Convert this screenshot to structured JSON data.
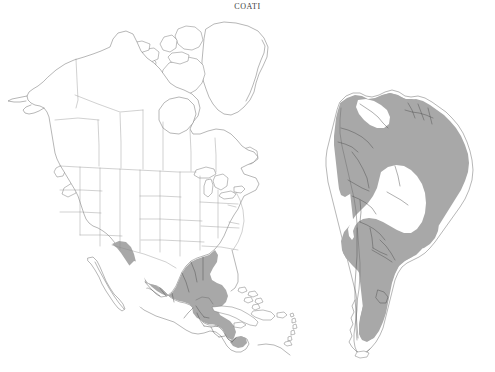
{
  "figure": {
    "title": "COATI",
    "type": "species-distribution-range-map",
    "background_color": "#ffffff",
    "range_fill_color": "#a8a8a8",
    "coastline_color": "#6e6e6e",
    "internal_border_color": "#8c8c8c",
    "title_color": "#3b3b3b"
  },
  "panels": [
    {
      "id": "north-america",
      "label": "North America",
      "position": "left",
      "range_present": true,
      "range_regions": [
        "southern Arizona",
        "southwestern New Mexico",
        "western Mexico",
        "eastern Mexico",
        "southern Mexico",
        "Yucatan Peninsula",
        "Belize",
        "Guatemala",
        "Honduras",
        "El Salvador",
        "Nicaragua",
        "Costa Rica",
        "Panama"
      ],
      "unshaded_interior": "central Mexican plateau",
      "features": [
        "Alaska",
        "Canada",
        "Greenland",
        "Canadian Arctic Archipelago",
        "Hudson Bay",
        "Great Lakes",
        "contiguous United States",
        "Baja California",
        "Gulf of Mexico",
        "Florida",
        "Cuba",
        "Bahamas",
        "Hispaniola",
        "Jamaica",
        "Puerto Rico",
        "Lesser Antilles"
      ]
    },
    {
      "id": "south-america",
      "label": "South America",
      "position": "right",
      "range_present": true,
      "range_regions": [
        "Colombia",
        "Ecuador",
        "Peru",
        "western Bolivia",
        "Guyana",
        "Suriname",
        "French Guiana",
        "northern Brazil",
        "eastern Brazil",
        "southeastern Brazil",
        "Paraguay",
        "northern Argentina",
        "Uruguay border"
      ],
      "unshaded_interior": "central Amazon basin",
      "features": [
        "Caribbean coast",
        "Andes",
        "Amazon basin",
        "Brazilian highlands",
        "Pampas",
        "Patagonia",
        "Tierra del Fuego"
      ]
    }
  ],
  "legend": {
    "range_meaning": "shaded gray area indicates species distribution"
  }
}
